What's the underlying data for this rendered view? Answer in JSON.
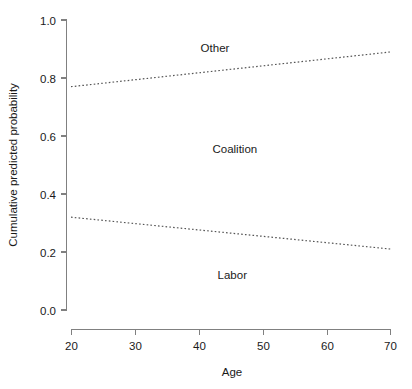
{
  "chart_data": {
    "type": "line",
    "title": "",
    "subtitle": "",
    "xlabel": "Age",
    "ylabel": "Cumulative predicted probability",
    "xlim": [
      20,
      70
    ],
    "ylim": [
      0.0,
      1.0
    ],
    "grid": false,
    "legend_position": "inline-annotations",
    "line_style": "dotted",
    "x": [
      20,
      70
    ],
    "xticks": [
      20,
      30,
      40,
      50,
      60,
      70
    ],
    "xticklabels": [
      "20",
      "30",
      "40",
      "50",
      "60",
      "70"
    ],
    "yticks": [
      0.0,
      0.2,
      0.4,
      0.6,
      0.8,
      1.0
    ],
    "yticklabels": [
      "0.0",
      "0.2",
      "0.4",
      "0.6",
      "0.8",
      "1.0"
    ],
    "series": [
      {
        "name": "upper-cumulative-boundary",
        "values": [
          0.77,
          0.89
        ]
      },
      {
        "name": "lower-cumulative-boundary",
        "values": [
          0.32,
          0.21
        ]
      }
    ],
    "annotations": [
      {
        "text": "Other",
        "x": 42.5,
        "y": 0.905
      },
      {
        "text": "Coalition",
        "x": 45.6,
        "y": 0.555
      },
      {
        "text": "Labor",
        "x": 45.2,
        "y": 0.122
      }
    ],
    "axis_color": "#808080",
    "line_color": "#555555",
    "text_color": "#1a1a1a",
    "background_color": "#ffffff"
  }
}
